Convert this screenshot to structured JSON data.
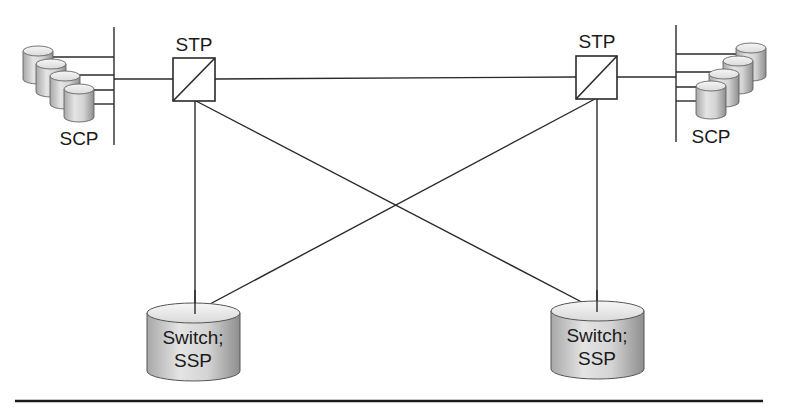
{
  "diagram": {
    "type": "SS7 signaling network topology",
    "colors": {
      "line": "#2a2a2a",
      "text": "#1a1a1a",
      "cylinder_light": "#e6e6e6",
      "cylinder_dark": "#9a9a9a",
      "cylinder_top": "#eeeeee",
      "background": "#ffffff"
    },
    "nodes": {
      "stp_left": {
        "label": "STP",
        "kind": "signal-transfer-point"
      },
      "stp_right": {
        "label": "STP",
        "kind": "signal-transfer-point"
      },
      "scp_left": {
        "label": "SCP",
        "kind": "service-control-point-database-group",
        "count": 4
      },
      "scp_right": {
        "label": "SCP",
        "kind": "service-control-point-database-group",
        "count": 4
      },
      "ssp_left": {
        "label_line1": "Switch;",
        "label_line2": "SSP",
        "kind": "service-switching-point"
      },
      "ssp_right": {
        "label_line1": "Switch;",
        "label_line2": "SSP",
        "kind": "service-switching-point"
      }
    },
    "links": [
      {
        "from": "scp_left",
        "to": "stp_left"
      },
      {
        "from": "stp_left",
        "to": "stp_right"
      },
      {
        "from": "stp_right",
        "to": "scp_right"
      },
      {
        "from": "stp_left",
        "to": "ssp_left"
      },
      {
        "from": "stp_left",
        "to": "ssp_right"
      },
      {
        "from": "stp_right",
        "to": "ssp_left"
      },
      {
        "from": "stp_right",
        "to": "ssp_right"
      }
    ]
  }
}
